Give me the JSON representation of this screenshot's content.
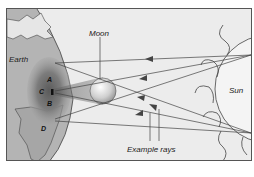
{
  "diagram": {
    "labels": {
      "earth": "Earth",
      "moon": "Moon",
      "sun": "Sun",
      "rays": "Example rays"
    },
    "points": {
      "a": "A",
      "b": "B",
      "c": "C",
      "d": "D"
    },
    "colors": {
      "background": "#ececec",
      "earth_land": "#b9b9b9",
      "earth_ocean": "#a8a8a8",
      "umbra": "#6e6e6e",
      "penumbra": "#9a9a9a",
      "sun_fill": "#f2f2f2",
      "line": "#444444"
    }
  }
}
